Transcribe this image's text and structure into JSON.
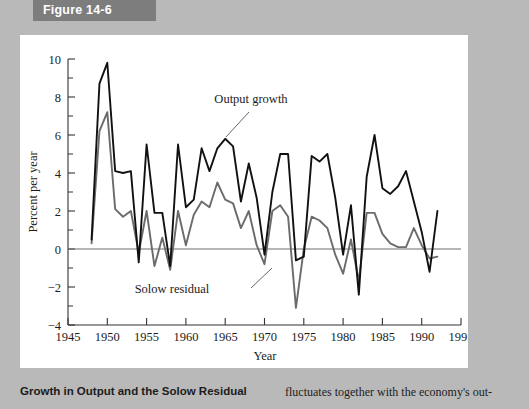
{
  "figure": {
    "banner_label": "Figure 14-6"
  },
  "caption": {
    "title": "Growth in Output and the Solow Residual",
    "body": "fluctuates together with the economy's out-"
  },
  "chart_data": {
    "type": "line",
    "title": "",
    "xlabel": "Year",
    "ylabel": "Percent per year",
    "xlim": [
      1945,
      1995
    ],
    "ylim": [
      -4,
      10
    ],
    "xticks": [
      1945,
      1950,
      1955,
      1960,
      1965,
      1970,
      1975,
      1980,
      1985,
      1990,
      1995
    ],
    "yticks": [
      -4,
      -2,
      0,
      2,
      4,
      6,
      8,
      10
    ],
    "yminorticks": [
      -3,
      -1,
      1,
      3,
      5,
      7,
      9
    ],
    "grid": false,
    "legend_position": "inline-annotations",
    "zero_line": 0,
    "x": [
      1948,
      1949,
      1950,
      1951,
      1952,
      1953,
      1954,
      1955,
      1956,
      1957,
      1958,
      1959,
      1960,
      1961,
      1962,
      1963,
      1964,
      1965,
      1966,
      1967,
      1968,
      1969,
      1970,
      1971,
      1972,
      1973,
      1974,
      1975,
      1976,
      1977,
      1978,
      1979,
      1980,
      1981,
      1982,
      1983,
      1984,
      1985,
      1986,
      1987,
      1988,
      1989,
      1990,
      1991,
      1992
    ],
    "series": [
      {
        "name": "Output growth",
        "color": "#111111",
        "values": [
          0.5,
          8.7,
          9.8,
          4.1,
          4.0,
          4.1,
          -0.7,
          5.5,
          1.9,
          1.9,
          -0.9,
          5.5,
          2.2,
          2.6,
          5.3,
          4.1,
          5.3,
          5.8,
          5.4,
          2.5,
          4.5,
          2.7,
          -0.3,
          3.0,
          5.0,
          5.0,
          -0.6,
          -0.4,
          4.9,
          4.6,
          5.0,
          2.7,
          -0.3,
          2.3,
          -2.4,
          3.8,
          6.0,
          3.2,
          2.9,
          3.3,
          4.1,
          2.5,
          0.9,
          -1.2,
          2.0
        ]
      },
      {
        "name": "Solow residual",
        "color": "#6b6b6b",
        "values": [
          0.3,
          6.2,
          7.2,
          2.1,
          1.7,
          2.0,
          -0.2,
          2.0,
          -0.9,
          0.6,
          -1.1,
          2.0,
          0.2,
          1.8,
          2.5,
          2.2,
          3.5,
          2.6,
          2.4,
          1.1,
          2.0,
          0.2,
          -0.8,
          2.0,
          2.3,
          1.7,
          -3.1,
          0.0,
          1.7,
          1.5,
          1.1,
          -0.3,
          -1.3,
          0.5,
          -1.7,
          1.9,
          1.9,
          0.8,
          0.3,
          0.1,
          0.1,
          1.1,
          0.2,
          -0.5,
          -0.4
        ]
      }
    ],
    "annotations": [
      {
        "name": "output-growth-label",
        "text": "Output growth",
        "x_px": 251,
        "y_px": 103,
        "leader_from": [
          249,
          112
        ],
        "leader_to": [
          226,
          137
        ]
      },
      {
        "name": "solow-residual-label",
        "text": "Solow residual",
        "x_px": 172,
        "y_px": 293,
        "leader_from": [
          251,
          288
        ],
        "leader_to": [
          272,
          268
        ]
      }
    ]
  }
}
